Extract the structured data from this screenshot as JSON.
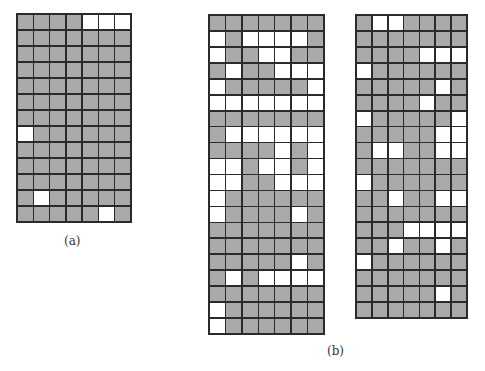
{
  "figure": {
    "labels": {
      "a": "(a)",
      "b": "(b)"
    },
    "colors": {
      "filled": "#a9a9a9",
      "empty": "#ffffff",
      "border": "#2a2a2a"
    },
    "grids": [
      {
        "id": "grid-a",
        "cols": 7,
        "rows": 13,
        "cells": [
          "GGGGWWW",
          "GGGGGGG",
          "GGGGGGG",
          "GGGGGGG",
          "GGGGGGG",
          "GGGGGGG",
          "GGGGGGG",
          "WGGGGGG",
          "GGGGGGG",
          "GGGGGGG",
          "GGGGGGG",
          "GWGGGGG",
          "GGGGGWG"
        ]
      },
      {
        "id": "grid-b-left",
        "cols": 7,
        "rows": 20,
        "cells": [
          "GGGGGGG",
          "WGWWWWG",
          "WGGWWGG",
          "GWGGWWW",
          "WGGGGGW",
          "WWWWWWW",
          "GGGGGGG",
          "GWWWWWW",
          "GGGGWGW",
          "WWGWWGW",
          "WWGGWWW",
          "WGGGGGG",
          "WGGGGWG",
          "GGGGGGG",
          "GGGGGGG",
          "GGGGGWG",
          "GWGWWWW",
          "GGGGGGG",
          "WGGGGGG",
          "WGGGGGG"
        ]
      },
      {
        "id": "grid-b-right",
        "cols": 7,
        "rows": 19,
        "cells": [
          "GWWGGGG",
          "GGGGGGG",
          "GGGGWWW",
          "WGGGGGG",
          "GGGGGWG",
          "GGGGWGG",
          "WGGGGGW",
          "GGGGGWW",
          "GWWGGWW",
          "GGGGGGG",
          "WGGGGGG",
          "GGWGGWW",
          "GGGGGGG",
          "GGGWWWW",
          "GGWGGWG",
          "WGGGGGG",
          "GGGGGGG",
          "GGGGGWG",
          "GGGGGGG"
        ]
      }
    ]
  }
}
